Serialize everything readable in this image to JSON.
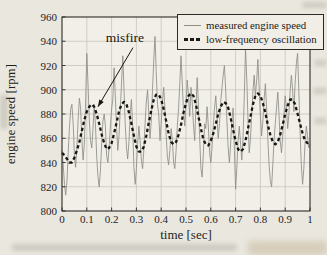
{
  "figure": {
    "page_background": "#eae7df",
    "plot_background": "#f2efe8",
    "frame_color": "#2a2a26",
    "grid_color": "#c7c4bb",
    "text_color": "#201f1b"
  },
  "chart_data": {
    "type": "line",
    "title": "",
    "xlabel": "time [sec]",
    "ylabel": "engine speed [rpm]",
    "xlim": [
      0,
      1
    ],
    "ylim": [
      800,
      960
    ],
    "grid": true,
    "legend_position": "top-right",
    "x_ticks": [
      0,
      0.1,
      0.2,
      0.3,
      0.4,
      0.5,
      0.6,
      0.7,
      0.8,
      0.9,
      1
    ],
    "x_tick_labels": [
      "0",
      "0.1",
      "0.2",
      "0.3",
      "0.4",
      "0.5",
      "0.6",
      "0.7",
      "0.8",
      "0.9",
      "1"
    ],
    "y_ticks": [
      800,
      820,
      840,
      860,
      880,
      900,
      920,
      940,
      960
    ],
    "y_tick_labels": [
      "800",
      "820",
      "840",
      "860",
      "880",
      "900",
      "920",
      "940",
      "960"
    ],
    "annotation": {
      "text": "misfire",
      "text_x": 0.254,
      "text_y": 943,
      "target_x": 0.145,
      "target_y": 886
    },
    "series": [
      {
        "name": "measured engine speed",
        "color": "#8d8d88",
        "line_width": 0.85,
        "line_style": "solid",
        "x_start": 0,
        "x_step": 0.005,
        "values": [
          850,
          838,
          822,
          813,
          825,
          848,
          868,
          884,
          888,
          872,
          846,
          836,
          852,
          875,
          893,
          885,
          860,
          842,
          855,
          890,
          930,
          905,
          875,
          858,
          852,
          868,
          888,
          870,
          845,
          828,
          820,
          833,
          856,
          874,
          880,
          870,
          846,
          840,
          852,
          870,
          884,
          892,
          918,
          895,
          868,
          850,
          862,
          884,
          905,
          928,
          900,
          872,
          852,
          843,
          858,
          880,
          892,
          870,
          836,
          822,
          835,
          855,
          870,
          858,
          842,
          835,
          850,
          872,
          890,
          900,
          880,
          860,
          875,
          900,
          925,
          944,
          915,
          888,
          880,
          858,
          872,
          890,
          902,
          885,
          862,
          845,
          838,
          850,
          868,
          858,
          840,
          835,
          850,
          870,
          885,
          905,
          928,
          905,
          882,
          870,
          888,
          908,
          895,
          878,
          902,
          890,
          872,
          858,
          885,
          910,
          888,
          862,
          835,
          828,
          848,
          872,
          868,
          886,
          870,
          848,
          840,
          852,
          870,
          885,
          895,
          878,
          860,
          872,
          890,
          902,
          912,
          920,
          900,
          875,
          852,
          840,
          855,
          875,
          885,
          850,
          818,
          835,
          858,
          870,
          855,
          842,
          860,
          895,
          934,
          908,
          875,
          848,
          860,
          880,
          900,
          912,
          895,
          908,
          925,
          900,
          878,
          862,
          875,
          892,
          905,
          885,
          860,
          838,
          825,
          820,
          838,
          858,
          872,
          885,
          898,
          880,
          858,
          848,
          862,
          880,
          895,
          885,
          868,
          880,
          900,
          912,
          900,
          882,
          905,
          922,
          930,
          900,
          865,
          838,
          822,
          835,
          855,
          870,
          862,
          852,
          855
        ]
      },
      {
        "name": "low-frequency oscillation",
        "color": "#161613",
        "line_width": 2.3,
        "line_style": "dashed",
        "x_start": 0,
        "x_step": 0.01,
        "values": [
          848,
          846,
          843,
          840,
          840,
          844,
          850,
          857,
          866,
          875,
          882,
          886,
          888,
          886,
          880,
          872,
          863,
          856,
          851,
          852,
          856,
          864,
          873,
          882,
          888,
          890,
          888,
          881,
          872,
          862,
          853,
          849,
          849,
          853,
          862,
          873,
          883,
          892,
          896,
          896,
          892,
          884,
          874,
          864,
          857,
          855,
          857,
          863,
          871,
          881,
          889,
          895,
          897,
          895,
          888,
          878,
          868,
          859,
          855,
          854,
          858,
          864,
          872,
          880,
          886,
          890,
          889,
          885,
          877,
          867,
          858,
          851,
          849,
          851,
          858,
          868,
          878,
          888,
          895,
          897,
          895,
          889,
          881,
          871,
          863,
          857,
          855,
          857,
          863,
          871,
          880,
          887,
          892,
          892,
          888,
          880,
          872,
          864,
          858,
          856,
          857
        ]
      }
    ]
  }
}
